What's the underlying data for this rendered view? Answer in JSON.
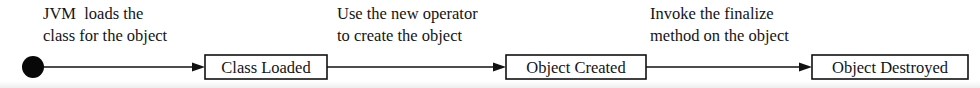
{
  "diagram": {
    "type": "state-transition-flow",
    "background_color": "#ffffff",
    "ink_color": "#111111",
    "initial_state": {
      "name": "initial-state-dot",
      "cx": 33,
      "cy": 67,
      "r": 11
    },
    "states": [
      {
        "id": "class-loaded",
        "label": "Class Loaded",
        "x": 205,
        "y": 55,
        "width": 122,
        "height": 24
      },
      {
        "id": "object-created",
        "label": "Object Created",
        "x": 506,
        "y": 55,
        "width": 140,
        "height": 24
      },
      {
        "id": "object-destroyed",
        "label": "Object Destroyed",
        "x": 812,
        "y": 55,
        "width": 156,
        "height": 24
      }
    ],
    "transitions": [
      {
        "id": "transition-load",
        "label_line1": "JVM  loads the",
        "label_line2": "class for the object",
        "label_x": 43,
        "label_y1": 19,
        "label_y2": 41,
        "from_x": 44,
        "to_x": 205,
        "y": 67
      },
      {
        "id": "transition-create",
        "label_line1": "Use the new operator",
        "label_line2": "to create the object",
        "label_x": 337,
        "label_y1": 19,
        "label_y2": 41,
        "from_x": 327,
        "to_x": 506,
        "y": 67
      },
      {
        "id": "transition-finalize",
        "label_line1": "Invoke the finalize",
        "label_line2": "method on the object",
        "label_x": 650,
        "label_y1": 19,
        "label_y2": 41,
        "from_x": 646,
        "to_x": 812,
        "y": 67
      }
    ],
    "arrow_head": {
      "length": 13,
      "half_height": 4.6
    }
  }
}
